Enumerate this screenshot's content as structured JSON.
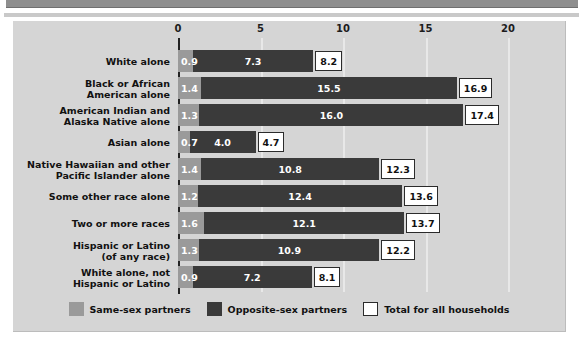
{
  "chart_data": {
    "type": "bar",
    "orientation": "horizontal",
    "stacked": true,
    "title": "",
    "subtitle": "",
    "xlabel": "",
    "ylabel": "",
    "xlim": [
      0,
      20
    ],
    "xticks": [
      0,
      5,
      10,
      15,
      20
    ],
    "xtick_labels": [
      "0",
      "5",
      "10",
      "15",
      "20"
    ],
    "grid": true,
    "legend_position": "bottom",
    "categories": [
      "White alone",
      "Black or African American alone",
      "American Indian and Alaska Native alone",
      "Asian alone",
      "Native Hawaiian and other Pacific Islander alone",
      "Some other race alone",
      "Two or more races",
      "Hispanic or Latino (of any race)",
      "White alone, not Hispanic or Latino"
    ],
    "series": [
      {
        "name": "Same-sex partners",
        "color": "#9a9a9a",
        "values": [
          0.9,
          1.4,
          1.3,
          0.7,
          1.4,
          1.2,
          1.6,
          1.3,
          0.9
        ]
      },
      {
        "name": "Opposite-sex partners",
        "color": "#3a3a3a",
        "values": [
          7.3,
          15.5,
          16.0,
          4.0,
          10.8,
          12.4,
          12.1,
          10.9,
          7.2
        ]
      },
      {
        "name": "Total for all households",
        "color": "#ffffff",
        "values": [
          8.2,
          16.9,
          17.4,
          4.7,
          12.3,
          13.6,
          13.7,
          12.2,
          8.1
        ]
      }
    ]
  },
  "rows": [
    {
      "label_lines": [
        "White alone"
      ],
      "same": "0.9",
      "opp": "7.3",
      "total": "8.2"
    },
    {
      "label_lines": [
        "Black or African",
        "American alone"
      ],
      "same": "1.4",
      "opp": "15.5",
      "total": "16.9"
    },
    {
      "label_lines": [
        "American Indian and",
        "Alaska Native alone"
      ],
      "same": "1.3",
      "opp": "16.0",
      "total": "17.4"
    },
    {
      "label_lines": [
        "Asian alone"
      ],
      "same": "0.7",
      "opp": "4.0",
      "total": "4.7"
    },
    {
      "label_lines": [
        "Native Hawaiian and other",
        "Pacific Islander alone"
      ],
      "same": "1.4",
      "opp": "10.8",
      "total": "12.3"
    },
    {
      "label_lines": [
        "Some other race alone"
      ],
      "same": "1.2",
      "opp": "12.4",
      "total": "13.6"
    },
    {
      "label_lines": [
        "Two or more races"
      ],
      "same": "1.6",
      "opp": "12.1",
      "total": "13.7"
    },
    {
      "label_lines": [
        "Hispanic or Latino",
        "(of any race)"
      ],
      "same": "1.3",
      "opp": "10.9",
      "total": "12.2"
    },
    {
      "label_lines": [
        "White alone, not",
        "Hispanic or Latino"
      ],
      "same": "0.9",
      "opp": "7.2",
      "total": "8.1"
    }
  ],
  "axis": {
    "ticks": [
      "0",
      "5",
      "10",
      "15",
      "20"
    ]
  },
  "legend": {
    "items": [
      {
        "label": "Same-sex partners",
        "swatch": "sw-same",
        "name": "legend-swatch-same-sex"
      },
      {
        "label": "Opposite-sex partners",
        "swatch": "sw-opp",
        "name": "legend-swatch-opposite-sex"
      },
      {
        "label": "Total for all households",
        "swatch": "sw-total",
        "name": "legend-swatch-total"
      }
    ]
  },
  "colors": {
    "same_sex": "#9a9a9a",
    "opposite_sex": "#3a3a3a",
    "total_box": "#ffffff",
    "panel_bg": "#d5d5d5",
    "gridline": "#e8e8e8",
    "header_bar": "#8e8e8e"
  }
}
